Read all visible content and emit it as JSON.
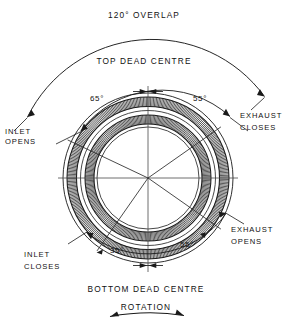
{
  "diagram": {
    "title_top": "120° OVERLAP",
    "top_dead_centre": "TOP DEAD CENTRE",
    "bottom_dead_centre": "BOTTOM DEAD CENTRE",
    "rotation_label": "ROTATION",
    "angles": {
      "overlap": "120°",
      "inlet_open_before_tdc": "65°",
      "exhaust_close_after_tdc": "55°",
      "inlet_close_after_bdc": "35°",
      "exhaust_open_before_bdc": "55°"
    },
    "events": {
      "inlet_opens": "INLET\nOPENS",
      "inlet_opens_line1": "INLET",
      "inlet_opens_line2": "OPENS",
      "exhaust_closes_line1": "EXHAUST",
      "exhaust_closes_line2": "CLOSES",
      "exhaust_opens_line1": "EXHAUST",
      "exhaust_opens_line2": "OPENS",
      "inlet_closes_line1": "INLET",
      "inlet_closes_line2": "CLOSES"
    },
    "colors": {
      "line": "#1a1a1a",
      "hatch": "#2b2b2b",
      "background": "#ffffff"
    }
  },
  "chart_data": {
    "type": "polar-timing",
    "center": {
      "x": 148,
      "y": 178
    },
    "reference_marks": [
      "TOP DEAD CENTRE",
      "BOTTOM DEAD CENTRE"
    ],
    "rotation_direction": "clockwise",
    "events": [
      {
        "name": "INLET OPENS",
        "angle_deg": 65,
        "reference": "before TDC",
        "label": "65°"
      },
      {
        "name": "EXHAUST CLOSES",
        "angle_deg": 55,
        "reference": "after TDC",
        "label": "55°"
      },
      {
        "name": "EXHAUST OPENS",
        "angle_deg": 55,
        "reference": "before BDC",
        "label": "55°"
      },
      {
        "name": "INLET CLOSES",
        "angle_deg": 35,
        "reference": "after BDC",
        "label": "35°"
      }
    ],
    "overlap_deg": 120,
    "overlap_label": "120° OVERLAP"
  }
}
